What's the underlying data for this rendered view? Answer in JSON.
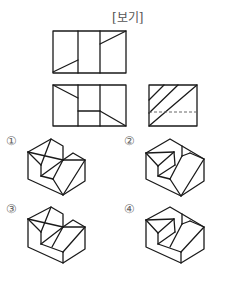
{
  "header": {
    "title": "[보기]"
  },
  "views": {
    "top_view": {
      "name": "평면도"
    },
    "front_view": {
      "name": "정면도"
    },
    "side_view": {
      "name": "우측면도"
    }
  },
  "options": [
    {
      "label": "①"
    },
    {
      "label": "②"
    },
    {
      "label": "③"
    },
    {
      "label": "④"
    }
  ]
}
